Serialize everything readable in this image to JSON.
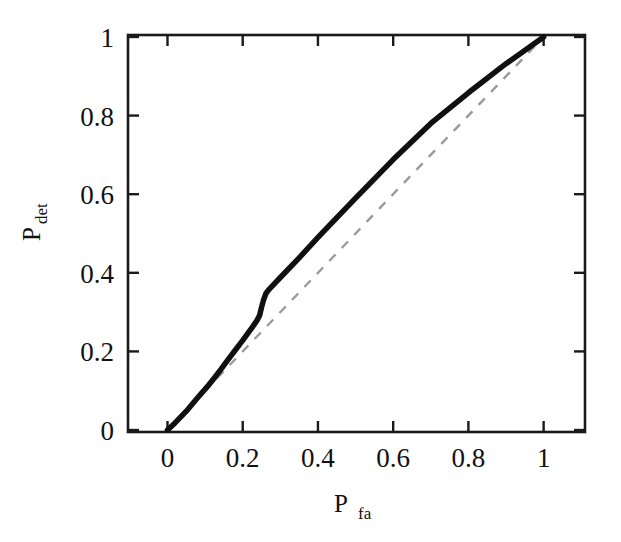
{
  "figure": {
    "background_color": "#ffffff",
    "axis_color": "#1a1a1a",
    "curve_color": "#101010",
    "reference_color": "#9a9a9a"
  },
  "chart_data": {
    "type": "line",
    "title": "",
    "subtitle": "",
    "xlabel": "P_fa",
    "xlabel_base": "P",
    "xlabel_sub": "fa",
    "ylabel": "P_det",
    "ylabel_base": "P",
    "ylabel_sub": "det",
    "xlim": [
      -0.105,
      1.11
    ],
    "ylim": [
      -0.005,
      1.005
    ],
    "xticks": [
      0,
      0.2,
      0.4,
      0.6,
      0.8,
      1
    ],
    "yticks": [
      0,
      0.2,
      0.4,
      0.6,
      0.8,
      1
    ],
    "xticklabels": [
      "0",
      "0.2",
      "0.4",
      "0.6",
      "0.8",
      "1"
    ],
    "yticklabels": [
      "0",
      "0.2",
      "0.4",
      "0.6",
      "0.8",
      "1"
    ],
    "grid": false,
    "legend": null,
    "legend_position": "none",
    "series": [
      {
        "name": "ROC curve",
        "style": "solid",
        "color": "#101010",
        "linewidth": 5.5,
        "x": [
          0.0,
          0.02,
          0.05,
          0.08,
          0.11,
          0.125,
          0.14,
          0.16,
          0.18,
          0.2,
          0.215,
          0.228,
          0.238,
          0.245,
          0.25,
          0.256,
          0.262,
          0.27,
          0.3,
          0.35,
          0.4,
          0.5,
          0.6,
          0.7,
          0.8,
          0.9,
          1.0
        ],
        "y": [
          0.0,
          0.018,
          0.048,
          0.082,
          0.115,
          0.133,
          0.152,
          0.178,
          0.203,
          0.228,
          0.248,
          0.265,
          0.279,
          0.292,
          0.312,
          0.333,
          0.348,
          0.358,
          0.388,
          0.438,
          0.49,
          0.59,
          0.688,
          0.78,
          0.858,
          0.932,
          1.0
        ]
      },
      {
        "name": "chance diagonal",
        "style": "dashed",
        "color": "#9a9a9a",
        "linewidth": 2.4,
        "x": [
          0.0,
          1.0
        ],
        "y": [
          0.0,
          1.0
        ]
      }
    ],
    "annotations": []
  }
}
